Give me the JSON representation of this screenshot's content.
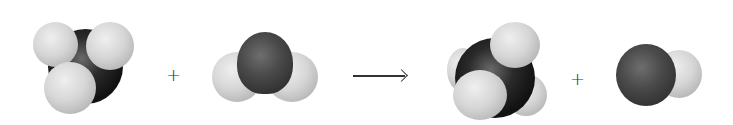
{
  "reaction": {
    "reactants": [
      {
        "name": "methyl",
        "formula": "CH3",
        "atoms": [
          "C",
          "H",
          "H",
          "H"
        ]
      },
      {
        "name": "water",
        "formula": "H2O",
        "atoms": [
          "O",
          "H",
          "H"
        ]
      }
    ],
    "products": [
      {
        "name": "methane",
        "formula": "CH4",
        "atoms": [
          "C",
          "H",
          "H",
          "H",
          "H"
        ]
      },
      {
        "name": "hydroxyl",
        "formula": "OH",
        "atoms": [
          "O",
          "H"
        ]
      }
    ],
    "plus_symbol": "+",
    "arrow_symbol": "→"
  },
  "colors": {
    "hydrogen": "#d6d6d6",
    "carbon": "#1a1a1a",
    "oxygen": "#444444",
    "background": "#ffffff",
    "symbol": "#333333"
  }
}
